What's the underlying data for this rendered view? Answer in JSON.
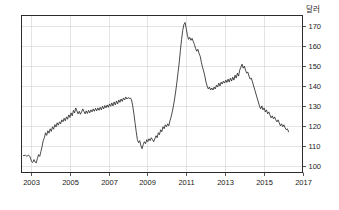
{
  "chart_data": {
    "type": "line",
    "title": "",
    "subtitle": "",
    "xlabel": "",
    "ylabel": "달러",
    "ylabel_unit_text": "달러",
    "xlim": [
      2002.5,
      2017.0
    ],
    "ylim": [
      96.5,
      175.5
    ],
    "yticks": [
      100,
      110,
      120,
      130,
      140,
      150,
      160,
      170
    ],
    "ytick_labels": [
      "100",
      "110",
      "120",
      "130",
      "140",
      "150",
      "160",
      "170"
    ],
    "xticks": [
      2003,
      2005,
      2007,
      2009,
      2011,
      2013,
      2015,
      2017
    ],
    "xtick_labels": [
      "2003",
      "2005",
      "2007",
      "2009",
      "2011",
      "2013",
      "2015",
      "2017"
    ],
    "grid": true,
    "grid_axes": "both",
    "legend": false,
    "legend_position": "none",
    "line_color": "#2b2b2b",
    "grid_color": "#c9c9c9",
    "frame_color": "#2b2b2b",
    "background_color": "#ffffff",
    "annotations": [],
    "series": [
      {
        "name": "달러",
        "x": [
          2002.6,
          2002.7,
          2002.78,
          2002.86,
          2002.94,
          2003.02,
          2003.08,
          2003.14,
          2003.2,
          2003.26,
          2003.32,
          2003.38,
          2003.44,
          2003.5,
          2003.56,
          2003.62,
          2003.68,
          2003.74,
          2003.8,
          2003.86,
          2003.92,
          2003.98,
          2004.04,
          2004.1,
          2004.16,
          2004.22,
          2004.28,
          2004.34,
          2004.4,
          2004.46,
          2004.52,
          2004.58,
          2004.64,
          2004.7,
          2004.76,
          2004.82,
          2004.88,
          2004.94,
          2005.0,
          2005.06,
          2005.12,
          2005.18,
          2005.24,
          2005.3,
          2005.36,
          2005.42,
          2005.48,
          2005.54,
          2005.6,
          2005.66,
          2005.72,
          2005.78,
          2005.84,
          2005.9,
          2005.96,
          2006.02,
          2006.08,
          2006.14,
          2006.2,
          2006.26,
          2006.32,
          2006.38,
          2006.44,
          2006.5,
          2006.56,
          2006.62,
          2006.68,
          2006.74,
          2006.8,
          2006.86,
          2006.92,
          2006.98,
          2007.04,
          2007.1,
          2007.16,
          2007.22,
          2007.28,
          2007.34,
          2007.4,
          2007.46,
          2007.52,
          2007.58,
          2007.64,
          2007.7,
          2007.76,
          2007.82,
          2007.88,
          2007.94,
          2008.0,
          2008.06,
          2008.12,
          2008.18,
          2008.24,
          2008.3,
          2008.36,
          2008.42,
          2008.48,
          2008.54,
          2008.6,
          2008.66,
          2008.72,
          2008.78,
          2008.84,
          2008.9,
          2008.96,
          2009.02,
          2009.08,
          2009.14,
          2009.2,
          2009.26,
          2009.32,
          2009.38,
          2009.44,
          2009.5,
          2009.56,
          2009.62,
          2009.68,
          2009.74,
          2009.8,
          2009.86,
          2009.92,
          2009.98,
          2010.04,
          2010.1,
          2010.16,
          2010.22,
          2010.28,
          2010.34,
          2010.4,
          2010.46,
          2010.52,
          2010.58,
          2010.64,
          2010.7,
          2010.76,
          2010.82,
          2010.88,
          2010.94,
          2011.0,
          2011.06,
          2011.12,
          2011.18,
          2011.24,
          2011.3,
          2011.36,
          2011.42,
          2011.48,
          2011.54,
          2011.6,
          2011.66,
          2011.72,
          2011.78,
          2011.84,
          2011.9,
          2011.96,
          2012.02,
          2012.08,
          2012.14,
          2012.2,
          2012.26,
          2012.32,
          2012.38,
          2012.44,
          2012.5,
          2012.56,
          2012.62,
          2012.68,
          2012.74,
          2012.8,
          2012.86,
          2012.92,
          2012.98,
          2013.04,
          2013.1,
          2013.16,
          2013.22,
          2013.28,
          2013.34,
          2013.4,
          2013.46,
          2013.52,
          2013.58,
          2013.64,
          2013.7,
          2013.76,
          2013.82,
          2013.88,
          2013.94,
          2014.0,
          2014.06,
          2014.12,
          2014.18,
          2014.24,
          2014.3,
          2014.36,
          2014.42,
          2014.48,
          2014.54,
          2014.6,
          2014.66,
          2014.72,
          2014.78,
          2014.84,
          2014.9,
          2014.96,
          2015.02,
          2015.08,
          2015.14,
          2015.2,
          2015.26,
          2015.32,
          2015.38,
          2015.44,
          2015.5,
          2015.56,
          2015.62,
          2015.68,
          2015.74,
          2015.8,
          2015.86,
          2015.92,
          2015.98,
          2016.04,
          2016.1,
          2016.16,
          2016.22,
          2016.28
        ],
        "y": [
          105.0,
          105.2,
          104.6,
          105.3,
          104.4,
          102.0,
          101.5,
          103.0,
          101.8,
          101.3,
          103.5,
          105.5,
          104.6,
          107.0,
          109.5,
          112.5,
          114.0,
          116.5,
          115.2,
          117.5,
          116.3,
          118.5,
          117.2,
          119.5,
          118.3,
          120.6,
          119.4,
          121.5,
          120.3,
          122.0,
          121.0,
          123.0,
          122.0,
          123.8,
          122.5,
          124.5,
          123.3,
          125.5,
          124.2,
          126.5,
          125.0,
          127.8,
          126.5,
          129.0,
          127.5,
          126.0,
          127.3,
          125.8,
          127.0,
          128.5,
          127.2,
          126.0,
          127.5,
          126.2,
          127.8,
          126.5,
          128.0,
          127.0,
          128.5,
          127.3,
          128.8,
          127.5,
          129.0,
          127.8,
          129.3,
          128.0,
          129.8,
          128.5,
          130.2,
          129.0,
          130.5,
          129.3,
          131.0,
          129.8,
          131.5,
          130.0,
          132.0,
          130.5,
          132.5,
          131.0,
          133.0,
          131.8,
          133.5,
          132.3,
          134.0,
          133.0,
          134.5,
          133.5,
          134.2,
          133.8,
          134.0,
          133.0,
          130.0,
          126.0,
          121.5,
          117.0,
          113.0,
          111.5,
          112.5,
          110.0,
          108.5,
          110.5,
          112.0,
          111.0,
          113.0,
          112.0,
          113.5,
          112.5,
          114.0,
          113.0,
          112.0,
          113.5,
          115.0,
          114.0,
          116.5,
          115.5,
          118.0,
          117.0,
          119.5,
          118.5,
          120.5,
          119.5,
          121.0,
          120.0,
          122.5,
          124.5,
          127.0,
          130.0,
          133.5,
          137.5,
          142.0,
          147.0,
          152.0,
          158.0,
          163.5,
          168.0,
          171.0,
          172.0,
          169.0,
          165.5,
          163.5,
          164.5,
          163.0,
          164.0,
          162.5,
          161.0,
          159.0,
          157.5,
          158.5,
          156.5,
          155.0,
          152.0,
          149.5,
          147.5,
          145.0,
          142.0,
          140.0,
          138.5,
          139.5,
          138.0,
          139.0,
          138.0,
          139.5,
          138.5,
          140.5,
          139.5,
          141.5,
          140.0,
          142.0,
          141.0,
          142.5,
          141.5,
          143.0,
          141.8,
          143.5,
          142.0,
          144.0,
          142.5,
          144.5,
          143.0,
          145.5,
          144.0,
          146.5,
          145.0,
          148.0,
          149.5,
          151.0,
          149.0,
          150.0,
          148.0,
          146.5,
          147.0,
          145.0,
          143.5,
          144.0,
          142.0,
          140.0,
          138.0,
          136.0,
          134.0,
          132.0,
          130.0,
          128.5,
          130.0,
          128.0,
          129.0,
          127.0,
          128.0,
          126.0,
          127.0,
          125.5,
          124.0,
          125.0,
          123.5,
          124.5,
          123.0,
          122.0,
          123.0,
          121.5,
          120.0,
          121.0,
          119.5,
          120.5,
          119.0,
          118.0,
          118.5,
          117.0
        ]
      }
    ]
  }
}
